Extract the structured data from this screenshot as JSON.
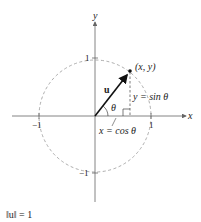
{
  "diagram": {
    "type": "unit-circle-vector",
    "axes": {
      "x_label": "x",
      "y_label": "y"
    },
    "ticks": {
      "x_neg": "−1",
      "x_pos": "1",
      "y_pos": "1",
      "y_neg": "−1"
    },
    "vector_label": "u",
    "point_label": "(x, y)",
    "angle_label": "θ",
    "vertical_label": "y = sin θ",
    "horizontal_label": "x = cos θ",
    "norm_caption": "‖u‖ = 1",
    "colors": {
      "axis": "#555555",
      "circle": "#999999",
      "vector": "#111111",
      "text": "#222222"
    }
  }
}
